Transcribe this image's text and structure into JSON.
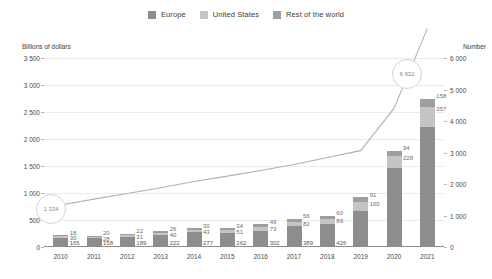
{
  "legend": {
    "items": [
      {
        "label": "Europe",
        "color": "#8d8d8d"
      },
      {
        "label": "United States",
        "color": "#c4c4c4"
      },
      {
        "label": "Rest of the world",
        "color": "#9e9e9e"
      }
    ]
  },
  "axes": {
    "left_title": "Billions of dollars",
    "right_title": "Number",
    "left_ticks": [
      "0",
      "500",
      "1 000",
      "1 500",
      "2 000",
      "2 500",
      "3 000",
      "3 500"
    ],
    "right_ticks": [
      "0",
      "1 000",
      "2 000",
      "3 000",
      "4 000",
      "5 000",
      "6 000"
    ]
  },
  "callouts": {
    "start": "1 334",
    "end": "6 932"
  },
  "chart_data": {
    "type": "bar",
    "title": "",
    "subtitle": "",
    "xlabel": "",
    "ylabel": "Billions of dollars",
    "y2label": "Number",
    "ylim": [
      0,
      3500
    ],
    "y2lim": [
      0,
      6000
    ],
    "grid": true,
    "legend_position": "top-center",
    "categories": [
      "2010",
      "2011",
      "2012",
      "2013",
      "2014",
      "2015",
      "2016",
      "2017",
      "2018",
      "2019",
      "2020",
      "2021"
    ],
    "series": [
      {
        "name": "Europe",
        "color": "#8d8d8d",
        "values": [
          165,
          158,
          189,
          222,
          277,
          262,
          302,
          389,
          426,
          673,
          1460,
          2231
        ],
        "labels": [
          "165",
          "158",
          "189",
          "222",
          "277",
          "262",
          "302",
          "389",
          "426",
          "673",
          "1 460",
          "2 231"
        ]
      },
      {
        "name": "United States",
        "color": "#c4c4c4",
        "values": [
          30,
          28,
          31,
          40,
          43,
          51,
          73,
          82,
          89,
          160,
          228,
          357
        ],
        "labels": [
          "30",
          "28",
          "31",
          "40",
          "43",
          "51",
          "73",
          "82",
          "89",
          "160",
          "228",
          "357"
        ]
      },
      {
        "name": "Rest of the world",
        "color": "#9e9e9e",
        "values": [
          18,
          20,
          22,
          26,
          30,
          34,
          49,
          56,
          60,
          91,
          94,
          158
        ],
        "labels": [
          "18",
          "20",
          "22",
          "26",
          "30",
          "34",
          "49",
          "56",
          "60",
          "91",
          "94",
          "158"
        ]
      }
    ],
    "line_series": {
      "name": "Number",
      "axis": "right",
      "color": "#b0b0b0",
      "values": [
        1334,
        1520,
        1700,
        1880,
        2080,
        2250,
        2430,
        2620,
        2840,
        3060,
        4400,
        6932
      ],
      "labels": [
        "1 334",
        "",
        "",
        "",
        "",
        "",
        "",
        "",
        "",
        "",
        "",
        "6 932"
      ]
    }
  }
}
